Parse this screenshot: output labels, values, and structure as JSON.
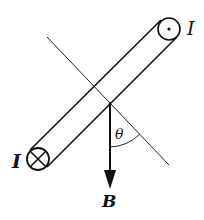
{
  "figure": {
    "colors": {
      "ink": "#111111",
      "background": "#ffffff"
    }
  },
  "labels": {
    "current_top": "I",
    "current_bottom": "I",
    "angle": "θ",
    "field": "B"
  },
  "symbols": {
    "top_conductor": "current-out-of-page (dot)",
    "bottom_conductor": "current-into-page (cross)"
  }
}
